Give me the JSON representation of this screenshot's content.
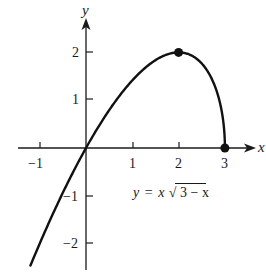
{
  "chart_data": {
    "type": "line",
    "title": "",
    "function": "y = x*sqrt(3 - x)",
    "annotation": {
      "y_part": "y",
      "eq_part": "=",
      "x_part": "x",
      "radical": "√",
      "radicand": "3 − x"
    },
    "xlabel": "x",
    "ylabel": "y",
    "xlim": [
      -1.5,
      3.6
    ],
    "ylim": [
      -2.6,
      2.8
    ],
    "x_ticks": [
      -1,
      1,
      2,
      3
    ],
    "x_tick_labels": [
      "−1",
      "1",
      "2",
      "3"
    ],
    "y_ticks": [
      -2,
      -1,
      1,
      2
    ],
    "y_tick_labels": [
      "−2",
      "−1",
      "1",
      "2"
    ],
    "grid": false,
    "legend": null,
    "series": [
      {
        "name": "y = x√(3 − x)",
        "x": [
          -1.2,
          -1.0,
          -0.5,
          0,
          0.5,
          1.0,
          1.5,
          2.0,
          2.5,
          2.8,
          2.95,
          3.0
        ],
        "values": [
          -2.46,
          -2.0,
          -0.94,
          0,
          0.79,
          1.41,
          1.84,
          2.0,
          1.77,
          1.25,
          0.65,
          0
        ]
      }
    ],
    "marked_points": [
      {
        "x": 2,
        "y": 2,
        "label": "local maximum"
      },
      {
        "x": 3,
        "y": 0,
        "label": "endpoint"
      }
    ]
  }
}
